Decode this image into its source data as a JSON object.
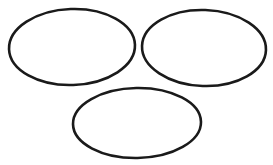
{
  "figure": {
    "width": 273,
    "height": 165,
    "background_color": "#ffffff",
    "stroke_color": "#1a1a1a",
    "shape_count": 3,
    "shape_type": "ellipse"
  },
  "chart_data": {
    "type": "scatter",
    "xlabel": "",
    "ylabel": "",
    "xlim": [
      0,
      273
    ],
    "ylim": [
      0,
      165
    ],
    "grid": false,
    "legend": "none",
    "shapes": [
      {
        "name": "ellipse-top-left",
        "type": "ellipse",
        "cx": 72,
        "cy": 47,
        "rx": 63,
        "ry": 38,
        "rotation": -2,
        "stroke": "#1a1a1a",
        "stroke_width": 2.6,
        "fill": "none"
      },
      {
        "name": "ellipse-top-right",
        "type": "ellipse",
        "cx": 204,
        "cy": 48,
        "rx": 62,
        "ry": 38,
        "rotation": 2,
        "stroke": "#1a1a1a",
        "stroke_width": 2.6,
        "fill": "none"
      },
      {
        "name": "ellipse-bottom-center",
        "type": "ellipse",
        "cx": 137,
        "cy": 123,
        "rx": 64,
        "ry": 35,
        "rotation": -1,
        "stroke": "#1a1a1a",
        "stroke_width": 2.6,
        "fill": "none"
      }
    ]
  }
}
